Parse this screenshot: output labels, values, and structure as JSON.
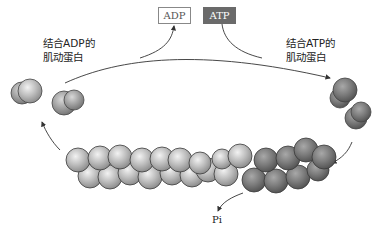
{
  "diagram": {
    "type": "actin treadmilling cycle",
    "labels": {
      "adp_box": "ADP",
      "atp_box": "ATP",
      "left_label_line1": "结合ADP的",
      "left_label_line2": "肌动蛋白",
      "right_label_line1": "结合ATP的",
      "right_label_line2": "肌动蛋白",
      "pi": "Pi"
    },
    "colors": {
      "adp_actin": "#b8b8b8",
      "atp_actin": "#7a7a7a",
      "atp_box_fill": "#6a6a6a",
      "adp_box_border": "#888888",
      "arrow": "#333333"
    }
  }
}
